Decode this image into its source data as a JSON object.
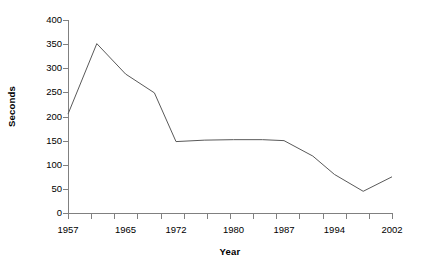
{
  "chart_data": {
    "type": "line",
    "title": "",
    "xlabel": "Year",
    "ylabel": "Seconds",
    "xlim": [
      1957,
      2002
    ],
    "ylim": [
      0,
      400
    ],
    "grid": false,
    "legend": null,
    "line_color": "#595959",
    "x": [
      1957,
      1961,
      1965,
      1969,
      1972,
      1976,
      1980,
      1984,
      1987,
      1991,
      1994,
      1998,
      2002
    ],
    "values": [
      205,
      351,
      288,
      249,
      148,
      151,
      152,
      152,
      150,
      118,
      80,
      45,
      75
    ],
    "series": [
      {
        "name": "Seconds",
        "values": [
          205,
          351,
          288,
          249,
          148,
          151,
          152,
          152,
          150,
          118,
          80,
          45,
          75
        ]
      }
    ],
    "x_tick_labels": [
      "1957",
      "1965",
      "1972",
      "1980",
      "1987",
      "1994",
      "2002"
    ],
    "x_tick_values": [
      1957,
      1965,
      1972,
      1980,
      1987,
      1994,
      2002
    ],
    "y_tick_labels": [
      "400",
      "350",
      "300",
      "250",
      "200",
      "150",
      "100",
      "50",
      "0"
    ],
    "y_tick_values": [
      400,
      350,
      300,
      250,
      200,
      150,
      100,
      50,
      0
    ],
    "x_minor_tick_count": 14
  },
  "axes": {
    "y_title": "Seconds",
    "x_title": "Year",
    "axis_color": "#808080"
  }
}
